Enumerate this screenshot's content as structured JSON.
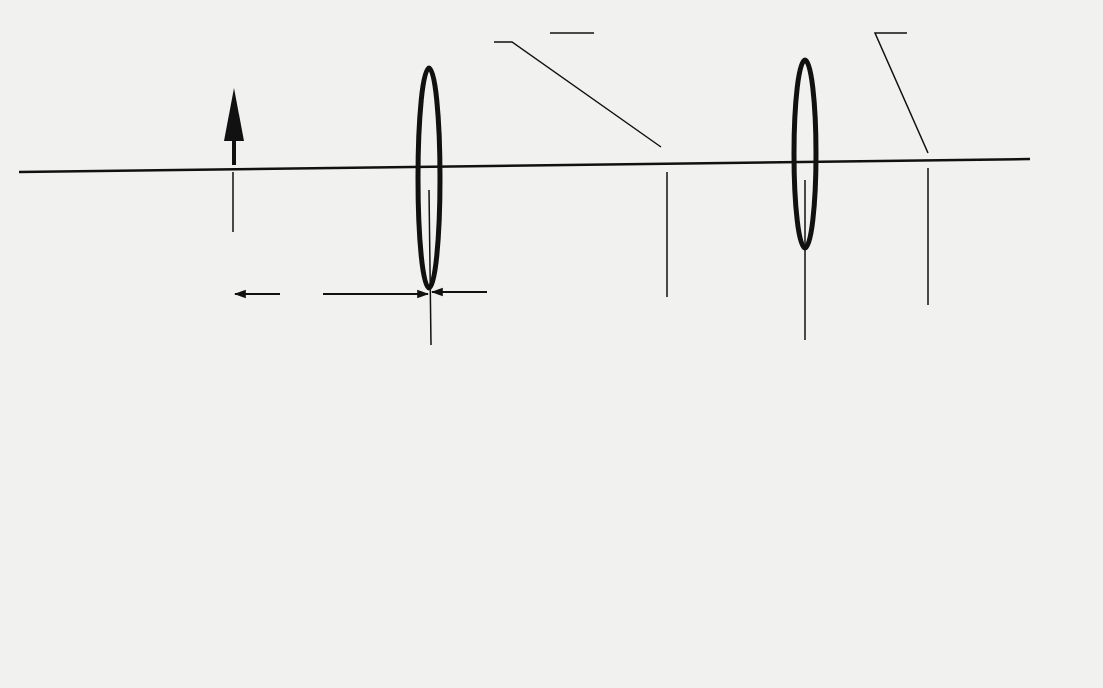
{
  "figure": {
    "panel_a": {
      "caption": "(a)",
      "lens1_label": "f",
      "lens1_sub": "1",
      "lens2_label": "f",
      "lens2_sub": "2",
      "callout_first_line1": "Location of",
      "callout_first_line2": "first image",
      "callout_final_line1": "Location of",
      "callout_final_line2": "final image",
      "dimensions": {
        "o1": {
          "base": "o",
          "sub": "1"
        },
        "i1": {
          "base": "i",
          "sub": "1"
        },
        "o2": {
          "base": "o",
          "sub": "2"
        },
        "i2": {
          "base": "i",
          "sub": "2"
        },
        "d": {
          "base": "d"
        }
      }
    },
    "panel_b": {
      "caption": "(b)"
    },
    "colors": {
      "ink": "#111111",
      "paper": "#f1f1ef"
    }
  }
}
